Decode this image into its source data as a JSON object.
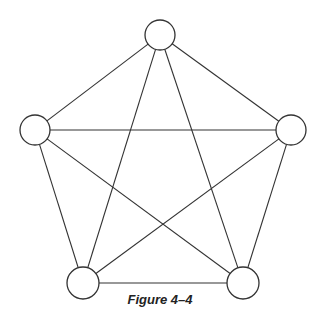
{
  "figure": {
    "caption": "Figure 4–4",
    "type": "complete-graph-K5",
    "stroke_color": "#333333",
    "nodes": [
      {
        "id": "top",
        "cx": 160,
        "cy": 35,
        "r": 15
      },
      {
        "id": "right",
        "cx": 291,
        "cy": 130,
        "r": 15
      },
      {
        "id": "bottom-right",
        "cx": 243,
        "cy": 283,
        "r": 16
      },
      {
        "id": "bottom-left",
        "cx": 83,
        "cy": 283,
        "r": 16
      },
      {
        "id": "left",
        "cx": 35,
        "cy": 130,
        "r": 15
      }
    ]
  }
}
